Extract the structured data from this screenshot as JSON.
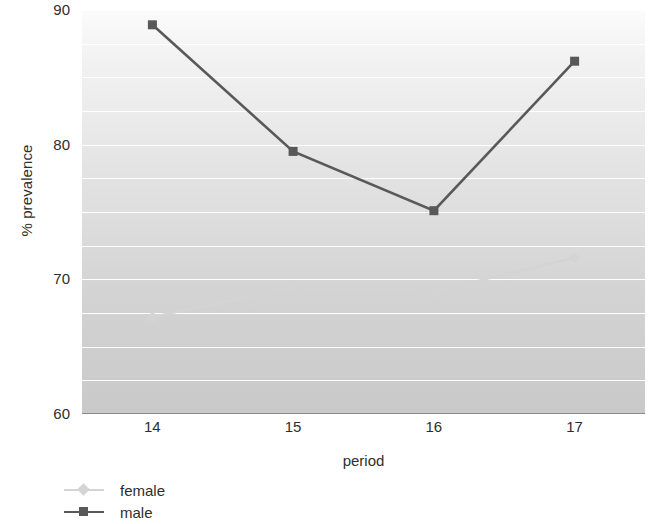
{
  "chart_data": {
    "type": "line",
    "title": "",
    "xlabel": "period",
    "ylabel": "% prevalence",
    "categories": [
      "14",
      "15",
      "16",
      "17"
    ],
    "x": [
      14,
      15,
      16,
      17
    ],
    "series": [
      {
        "name": "female",
        "values": [
          67.2,
          69.4,
          69.1,
          71.6
        ],
        "color": "#d4d4d4",
        "marker": "diamond"
      },
      {
        "name": "male",
        "values": [
          88.9,
          79.5,
          75.1,
          86.2
        ],
        "color": "#595959",
        "marker": "square"
      }
    ],
    "ylim": [
      60,
      90
    ],
    "xlim": [
      13.5,
      17.5
    ],
    "yticks": [
      60,
      70,
      80,
      90
    ],
    "ytick_labels": [
      "60",
      "70",
      "80",
      "90"
    ],
    "minor_gridlines": [
      62.5,
      65,
      67.5,
      72.5,
      75,
      77.5,
      82.5,
      85,
      87.5
    ],
    "grid": true,
    "legend_position": "bottom-left",
    "legend": [
      "female",
      "male"
    ]
  },
  "axes": {
    "y_title": "% prevalence",
    "x_title": "period"
  },
  "legend": {
    "items": [
      {
        "label": "female"
      },
      {
        "label": "male"
      }
    ]
  }
}
